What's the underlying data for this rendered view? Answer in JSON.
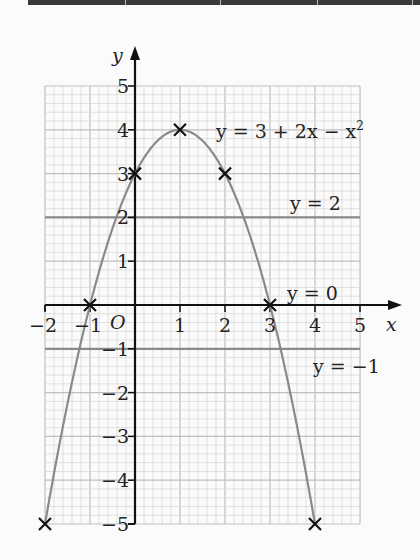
{
  "chart_data": {
    "type": "line",
    "title": "",
    "xlabel": "x",
    "ylabel": "y",
    "origin_label": "O",
    "xlim": [
      -2,
      5
    ],
    "ylim": [
      -5,
      5
    ],
    "grid": true,
    "minor_per_unit": 5,
    "x_ticks": [
      -2,
      -1,
      1,
      2,
      3,
      4,
      5
    ],
    "y_ticks": [
      5,
      4,
      3,
      2,
      1,
      -1,
      -2,
      -3,
      -4,
      -5
    ],
    "x_tick_labels": [
      "−2",
      "−1",
      "1",
      "2",
      "3",
      "4",
      "5"
    ],
    "y_tick_labels": [
      "5",
      "4",
      "3",
      "2",
      "1",
      "−1",
      "−2",
      "−3",
      "−4",
      "−5"
    ],
    "series": [
      {
        "name": "y = 3 + 2x − x²",
        "kind": "curve",
        "equation": "3 + 2x - x^2",
        "x_range": [
          -2,
          4
        ],
        "marked_points": [
          {
            "x": -2,
            "y": -5
          },
          {
            "x": -1,
            "y": 0
          },
          {
            "x": 0,
            "y": 3
          },
          {
            "x": 1,
            "y": 4
          },
          {
            "x": 2,
            "y": 3
          },
          {
            "x": 3,
            "y": 0
          },
          {
            "x": 4,
            "y": -5
          }
        ]
      },
      {
        "name": "y = 2",
        "kind": "hline",
        "y": 2
      },
      {
        "name": "y = 0",
        "kind": "hline",
        "y": 0
      },
      {
        "name": "y = −1",
        "kind": "hline",
        "y": -1
      }
    ],
    "annotations": [
      {
        "text": "y = 3 + 2x − x²",
        "near": [
          1.9,
          4
        ]
      },
      {
        "text": "y = 2",
        "near": [
          3.5,
          2.2
        ]
      },
      {
        "text": "y = 0",
        "near": [
          3.4,
          0.25
        ]
      },
      {
        "text": "y = −1",
        "near": [
          4.0,
          -1.4
        ]
      }
    ]
  },
  "labels": {
    "x_axis": "x",
    "y_axis": "y",
    "origin": "O",
    "curve": "y = 3 + 2x − x",
    "curve_sup": "2",
    "line_y2": "y = 2",
    "line_y0": "y = 0",
    "line_ym1": "y = −1"
  },
  "colors": {
    "grid_minor": "#d9d9d9",
    "grid_major": "#bfbfbf",
    "curve": "#8a8a8a",
    "hline": "#8a8a8a",
    "axis": "#111111",
    "marker": "#111111"
  }
}
